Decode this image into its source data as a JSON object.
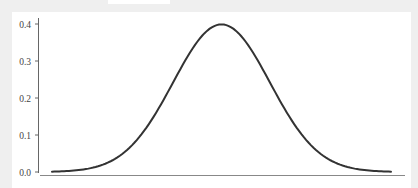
{
  "chart_data": {
    "type": "line",
    "title": "",
    "xlabel": "",
    "ylabel": "",
    "ylim": [
      0.0,
      0.4
    ],
    "xlim": [
      -3.5,
      3.5
    ],
    "grid": false,
    "legend": null,
    "y_ticks": [
      "0.0",
      "0.1",
      "0.2",
      "0.3",
      "0.4"
    ],
    "x_ticks": [],
    "series": [
      {
        "name": "normal-pdf",
        "color": "#333333",
        "x": [
          -3.5,
          -3.0,
          -2.5,
          -2.0,
          -1.5,
          -1.0,
          -0.5,
          0.0,
          0.5,
          1.0,
          1.5,
          2.0,
          2.5,
          3.0,
          3.5
        ],
        "values": [
          0.0009,
          0.0044,
          0.0175,
          0.054,
          0.1295,
          0.242,
          0.3521,
          0.3989,
          0.3521,
          0.242,
          0.1295,
          0.054,
          0.0175,
          0.0044,
          0.0009
        ]
      }
    ]
  },
  "axes": {
    "y_tick_labels": [
      "0.4",
      "0.3",
      "0.2",
      "0.1",
      "0.0"
    ]
  }
}
